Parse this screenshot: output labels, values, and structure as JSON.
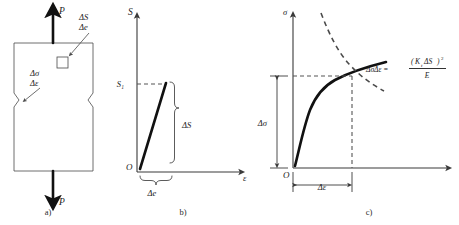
{
  "figure": {
    "caption_a": "a)",
    "caption_b": "b)",
    "caption_c": "c)"
  },
  "panel_a": {
    "name": "notched-specimen",
    "load_top_label": "P",
    "load_bottom_label": "P",
    "element_labels": {
      "nominal_stress": "ΔS",
      "nominal_strain": "Δe"
    },
    "notch_labels": {
      "local_stress": "Δσ",
      "local_strain": "Δε"
    }
  },
  "panel_b": {
    "name": "nominal-stress-strain-plot",
    "y_axis_label": "S",
    "x_axis_label": "ε",
    "origin_label": "O",
    "tick_label": "S₁",
    "delta_s_label": "ΔS",
    "delta_e_label": "Δe"
  },
  "panel_c": {
    "name": "local-stress-strain-plot",
    "y_axis_label": "σ",
    "origin_label": "O",
    "delta_sigma_label": "Δσ",
    "delta_epsilon_label": "Δε",
    "equation": {
      "lhs": "ΔσΔε =",
      "numerator_open": "(",
      "numerator_k": "K",
      "numerator_k_sub": "t",
      "numerator_ds": "ΔS",
      "numerator_close": ")",
      "numerator_exp": "2",
      "denominator": "E"
    }
  },
  "colors": {
    "curve": "#111111",
    "axis": "#3a3a3a",
    "dashed": "#4a4a4a",
    "text": "#1a1a1a",
    "background": "#ffffff"
  }
}
